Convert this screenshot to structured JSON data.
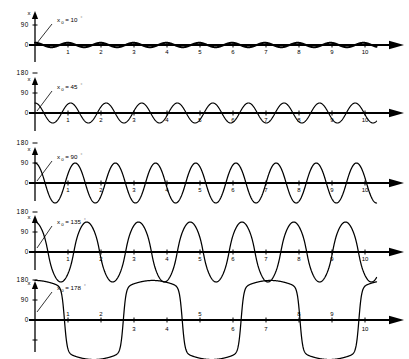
{
  "figure": {
    "axis_label_y": "x",
    "xticks": [
      "1",
      "2",
      "3",
      "4",
      "5",
      "6",
      "7",
      "8",
      "9",
      "10"
    ]
  },
  "panels": [
    {
      "id": "panel-10deg",
      "label_var": "x",
      "label_sub": "0",
      "label_eq": "= 10",
      "label_deg": "°",
      "yticks": [
        "90",
        "0"
      ],
      "ytick_values": [
        90,
        0
      ]
    },
    {
      "id": "panel-45deg",
      "label_var": "x",
      "label_sub": "0",
      "label_eq": "= 45",
      "label_deg": "°",
      "yticks": [
        "180",
        "90",
        "0"
      ],
      "ytick_values": [
        180,
        90,
        0
      ]
    },
    {
      "id": "panel-90deg",
      "label_var": "x",
      "label_sub": "0",
      "label_eq": "= 90",
      "label_deg": "°",
      "yticks": [
        "180",
        "90",
        "0"
      ],
      "ytick_values": [
        180,
        90,
        0
      ]
    },
    {
      "id": "panel-135deg",
      "label_var": "x",
      "label_sub": "0",
      "label_eq": "= 135",
      "label_deg": "°",
      "yticks": [
        "180",
        "90",
        "0"
      ],
      "ytick_values": [
        180,
        90,
        0
      ]
    },
    {
      "id": "panel-178deg",
      "label_var": "x",
      "label_sub": "0",
      "label_eq": "= 178",
      "label_deg": "°",
      "yticks": [
        "180",
        "90",
        "0"
      ],
      "ytick_values": [
        180,
        90,
        0
      ]
    }
  ],
  "chart_data": {
    "type": "line",
    "title": "",
    "xlabel": "",
    "ylabel": "x",
    "xlim": [
      0,
      10.6
    ],
    "grid": false,
    "legend": "none",
    "series": [
      {
        "name": "x0 = 10°",
        "amplitude": 10,
        "cycles": 10.4,
        "waveform": "sinusoid",
        "anharmonicity": 0.0,
        "xlabel_ticks": [
          "1",
          "2",
          "3",
          "4",
          "5",
          "6",
          "7",
          "8",
          "9",
          "10"
        ],
        "ytick_labels": [
          "90",
          "0"
        ],
        "ytick_values": [
          90,
          0
        ]
      },
      {
        "name": "x0 = 45°",
        "amplitude": 45,
        "cycles": 9.6,
        "waveform": "sinusoid",
        "anharmonicity": 0.04,
        "xlabel_ticks": [
          "1",
          "2",
          "3",
          "4",
          "5",
          "6",
          "7",
          "8",
          "9",
          "10"
        ],
        "ytick_labels": [
          "180",
          "90",
          "0"
        ],
        "ytick_values": [
          180,
          90,
          0
        ]
      },
      {
        "name": "x0 = 90°",
        "amplitude": 90,
        "cycles": 8.5,
        "waveform": "sinusoid",
        "anharmonicity": 0.1,
        "xlabel_ticks": [
          "1",
          "2",
          "3",
          "4",
          "5",
          "6",
          "7",
          "8",
          "9",
          "10"
        ],
        "ytick_labels": [
          "180",
          "90",
          "0"
        ],
        "ytick_values": [
          180,
          90,
          0
        ]
      },
      {
        "name": "x0 = 135°",
        "amplitude": 135,
        "cycles": 6.6,
        "waveform": "quasi-sinusoid",
        "anharmonicity": 0.22,
        "xlabel_ticks": [
          "1",
          "2",
          "3",
          "4",
          "5",
          "6",
          "7",
          "8",
          "9",
          "10"
        ],
        "ytick_labels": [
          "180",
          "90",
          "0"
        ],
        "ytick_values": [
          180,
          90,
          0
        ]
      },
      {
        "name": "x0 = 178°",
        "amplitude": 178,
        "cycles": 2.9,
        "waveform": "near-square",
        "anharmonicity": 0.8,
        "xlabel_ticks": [
          "1",
          "2",
          "3",
          "4",
          "5",
          "6",
          "7",
          "8",
          "9",
          "10"
        ],
        "ytick_labels": [
          "180",
          "90",
          "0"
        ],
        "ytick_values": [
          180,
          90,
          0
        ]
      }
    ]
  }
}
